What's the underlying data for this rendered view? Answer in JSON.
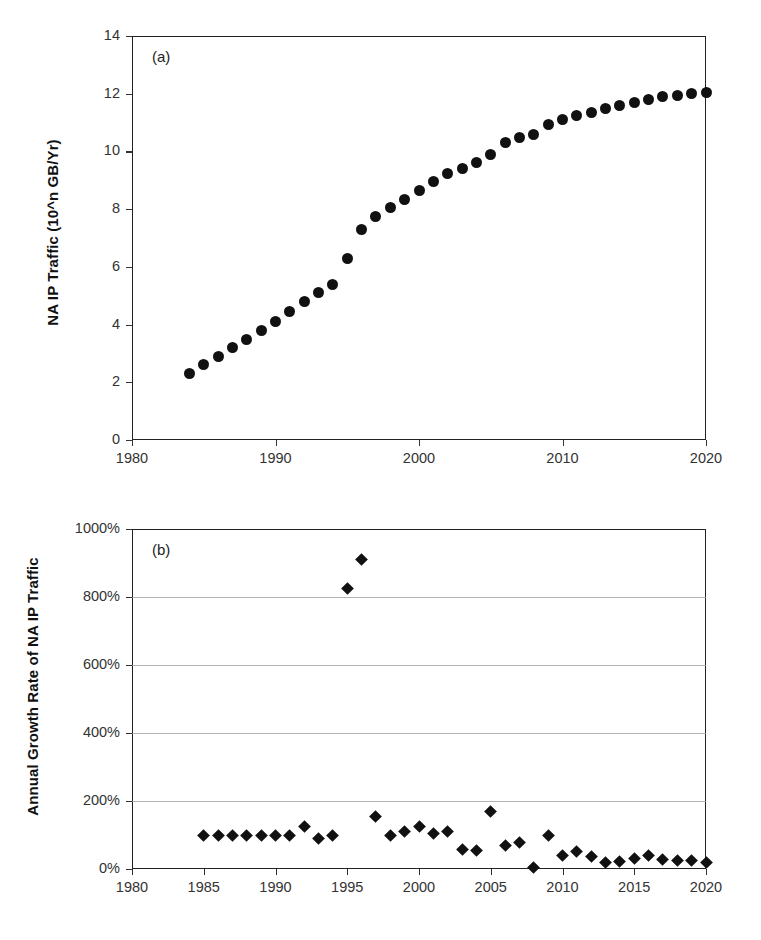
{
  "figure": {
    "width": 761,
    "height": 940,
    "background": "#ffffff",
    "marker_color": "#111111",
    "axis_color": "#222222",
    "gridline_color": "#9a9a9a"
  },
  "panels": [
    {
      "tag": "(a)",
      "name": "panel-a"
    },
    {
      "tag": "(b)",
      "name": "panel-b"
    }
  ],
  "chart_data": [
    {
      "type": "scatter",
      "panel": "(a)",
      "title": "",
      "xlabel": "",
      "ylabel": "NA IP Traffic (10^n GB/Yr)",
      "xlim": [
        1980,
        2020
      ],
      "ylim": [
        0,
        14
      ],
      "xticks": [
        1980,
        1990,
        2000,
        2010,
        2020
      ],
      "xtick_labels": [
        "1980",
        "1990",
        "2000",
        "2010",
        "2020"
      ],
      "yticks": [
        0,
        2,
        4,
        6,
        8,
        10,
        12,
        14
      ],
      "ytick_labels": [
        "0",
        "2",
        "4",
        "6",
        "8",
        "10",
        "12",
        "14"
      ],
      "grid": false,
      "legend": null,
      "marker": "filled-circle",
      "series": [
        {
          "name": "NA IP Traffic",
          "x": [
            1984,
            1985,
            1986,
            1987,
            1988,
            1989,
            1990,
            1991,
            1992,
            1993,
            1994,
            1995,
            1996,
            1997,
            1998,
            1999,
            2000,
            2001,
            2002,
            2003,
            2004,
            2005,
            2006,
            2007,
            2008,
            2009,
            2010,
            2011,
            2012,
            2013,
            2014,
            2015,
            2016,
            2017,
            2018,
            2019,
            2020
          ],
          "values": [
            2.3,
            2.6,
            2.9,
            3.2,
            3.5,
            3.8,
            4.1,
            4.45,
            4.8,
            5.1,
            5.4,
            6.3,
            7.3,
            7.75,
            8.05,
            8.35,
            8.65,
            8.95,
            9.25,
            9.4,
            9.6,
            9.9,
            10.3,
            10.5,
            10.6,
            10.95,
            11.1,
            11.25,
            11.35,
            11.5,
            11.6,
            11.7,
            11.8,
            11.9,
            11.95,
            12.0,
            12.05
          ]
        }
      ]
    },
    {
      "type": "scatter",
      "panel": "(b)",
      "title": "",
      "xlabel": "",
      "ylabel": "Annual Growth Rate of NA IP Traffic",
      "xlim": [
        1980,
        2020
      ],
      "ylim": [
        0,
        1000
      ],
      "xticks": [
        1980,
        1985,
        1990,
        1995,
        2000,
        2005,
        2010,
        2015,
        2020
      ],
      "xtick_labels": [
        "1980",
        "1985",
        "1990",
        "1995",
        "2000",
        "2005",
        "2010",
        "2015",
        "2020"
      ],
      "yticks": [
        0,
        200,
        400,
        600,
        800,
        1000
      ],
      "ytick_labels": [
        "0%",
        "200%",
        "400%",
        "600%",
        "800%",
        "1000%"
      ],
      "grid": true,
      "gridlines_at": [
        200,
        400,
        600,
        800
      ],
      "legend": null,
      "marker": "filled-diamond",
      "unit": "%",
      "series": [
        {
          "name": "Annual Growth Rate of NA IP Traffic",
          "x": [
            1985,
            1986,
            1987,
            1988,
            1989,
            1990,
            1991,
            1992,
            1993,
            1994,
            1995,
            1996,
            1997,
            1998,
            1999,
            2000,
            2001,
            2002,
            2003,
            2004,
            2005,
            2006,
            2007,
            2008,
            2009,
            2010,
            2011,
            2012,
            2013,
            2014,
            2015,
            2016,
            2017,
            2018,
            2019,
            2020
          ],
          "values": [
            100,
            100,
            100,
            100,
            100,
            100,
            100,
            125,
            90,
            100,
            825,
            910,
            155,
            100,
            110,
            125,
            105,
            110,
            58,
            55,
            170,
            68,
            78,
            3,
            100,
            40,
            52,
            38,
            18,
            22,
            30,
            40,
            28,
            25,
            25,
            20
          ]
        }
      ]
    }
  ]
}
